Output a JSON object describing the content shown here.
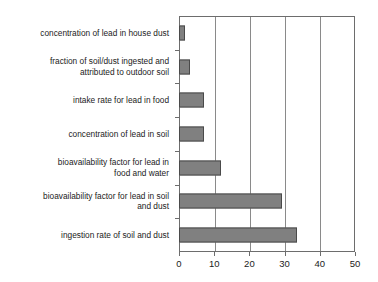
{
  "chart_data": {
    "type": "bar",
    "orientation": "horizontal",
    "title": "",
    "subtitle": "",
    "xlabel": "",
    "ylabel": "",
    "xlim": [
      0,
      50
    ],
    "xticks": [
      0,
      10,
      20,
      30,
      40,
      50
    ],
    "xtick_labels": [
      "0",
      "10",
      "20",
      "30",
      "40",
      "50"
    ],
    "grid": "vertical",
    "legend": "none",
    "bar_color": "#808080",
    "bar_edge_color": "#4a4a4a",
    "axis_color": "#6d6d6d",
    "categories": [
      "concentration of lead in house dust",
      "fraction of soil/dust ingested and\nattributed to outdoor soil",
      "intake rate for lead in food",
      "concentration of lead in soil",
      "bioavailability factor for lead in\nfood and water",
      "bioavailability factor for lead in soil\nand dust",
      "ingestion rate of soil and dust"
    ],
    "values": [
      1.8,
      3.1,
      7.0,
      7.1,
      12.0,
      29.3,
      33.4
    ]
  }
}
